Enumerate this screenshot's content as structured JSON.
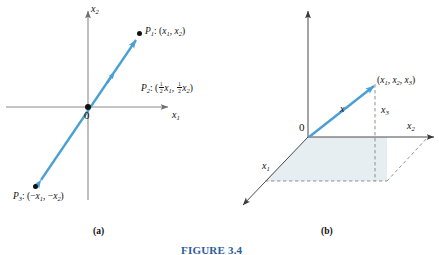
{
  "figure": {
    "caption": "FIGURE 3.4",
    "caption_color": "#2d5c9e",
    "accent_color": "#4a9fd4",
    "axis_color": "#8a8a8a",
    "plane_fill": "#e6eef2",
    "background": "#ffffff"
  },
  "panel_a": {
    "sublabel": "(a)",
    "axis_x": "x",
    "axis_x_sub": "1",
    "axis_y": "x",
    "axis_y_sub": "2",
    "origin": "0",
    "points": [
      {
        "name": "P",
        "name_sub": "1",
        "sep": ": (",
        "coord1": "x",
        "coord1_sub": "1",
        "comma": ", ",
        "coord2": "x",
        "coord2_sub": "2",
        "close": ")"
      },
      {
        "name": "P",
        "name_sub": "3",
        "sep": ": (−",
        "coord1": "x",
        "coord1_sub": "1",
        "comma": ", −",
        "coord2": "x",
        "coord2_sub": "2",
        "close": ")"
      }
    ],
    "midpoint": {
      "name": "P",
      "name_sub": "2",
      "sep": ": (",
      "frac_num": "1",
      "frac_den": "2",
      "coord1": "x",
      "coord1_sub": "1",
      "comma": ", ",
      "coord2": "x",
      "coord2_sub": "2",
      "close": ")"
    }
  },
  "panel_b": {
    "sublabel": "(b)",
    "origin": "0",
    "vector_label": "x",
    "axis_x1": "x",
    "axis_x1_sub": "1",
    "axis_x2": "x",
    "axis_x2_sub": "2",
    "axis_x3": "x",
    "axis_x3_sub": "3",
    "point": {
      "open": "(",
      "c1": "x",
      "c1_sub": "1",
      "sep1": ", ",
      "c2": "x",
      "c2_sub": "2",
      "sep2": ", ",
      "c3": "x",
      "c3_sub": "3",
      "close": ")"
    }
  }
}
